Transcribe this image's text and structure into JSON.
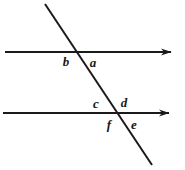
{
  "figure": {
    "canvas": {
      "width": 185,
      "height": 170
    },
    "background_color": "#ffffff",
    "stroke_color": "#1a1a1a",
    "line_width": 2,
    "lines": [
      {
        "id": "upper-parallel-line",
        "name": "upper horizontal line",
        "x1": 5,
        "y1": 52,
        "x2": 171,
        "y2": 52,
        "arrow_end": "right"
      },
      {
        "id": "lower-parallel-line",
        "name": "lower horizontal line",
        "x1": 3,
        "y1": 113,
        "x2": 169,
        "y2": 113,
        "arrow_end": "right"
      },
      {
        "id": "transversal-line",
        "name": "transversal",
        "x1": 45,
        "y1": 4,
        "x2": 152,
        "y2": 165,
        "arrow_end": "none"
      }
    ],
    "intersections": [
      {
        "id": "upper-intersection",
        "x": 77,
        "y": 53
      },
      {
        "id": "lower-intersection",
        "x": 115,
        "y": 113
      }
    ],
    "labels": [
      {
        "id": "angle-label-b",
        "text": "b",
        "x": 66,
        "y": 61,
        "position": "below-left of upper intersection"
      },
      {
        "id": "angle-label-a",
        "text": "a",
        "x": 93,
        "y": 62,
        "position": "below-right of upper intersection"
      },
      {
        "id": "angle-label-c",
        "text": "c",
        "x": 96,
        "y": 103,
        "position": "above-left of lower intersection"
      },
      {
        "id": "angle-label-d",
        "text": "d",
        "x": 124,
        "y": 102,
        "position": "above-right of lower intersection"
      },
      {
        "id": "angle-label-f",
        "text": "f",
        "x": 109,
        "y": 124,
        "position": "below-left of lower intersection"
      },
      {
        "id": "angle-label-e",
        "text": "e",
        "x": 134,
        "y": 124,
        "position": "below-right of lower intersection"
      }
    ]
  }
}
